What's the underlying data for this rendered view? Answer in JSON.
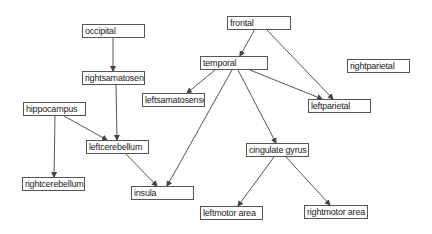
{
  "diagram": {
    "type": "directed-graph",
    "nodes": [
      {
        "id": "occipital",
        "label": "occipital",
        "x": 82,
        "y": 24,
        "w": 63
      },
      {
        "id": "rightsamatosens",
        "label": "rightsamatosens",
        "x": 82,
        "y": 71,
        "w": 63
      },
      {
        "id": "hippocampus",
        "label": "hippocampus",
        "x": 23,
        "y": 102,
        "w": 63
      },
      {
        "id": "leftcerebellum",
        "label": "leftcerebellum",
        "x": 86,
        "y": 140,
        "w": 63
      },
      {
        "id": "rightcerebellum",
        "label": "rightcerebellum",
        "x": 22,
        "y": 177,
        "w": 63
      },
      {
        "id": "insula",
        "label": "insula",
        "x": 131,
        "y": 186,
        "w": 63
      },
      {
        "id": "frontal",
        "label": "frontal",
        "x": 227,
        "y": 16,
        "w": 64
      },
      {
        "id": "temporal",
        "label": "temporal",
        "x": 200,
        "y": 56,
        "w": 68
      },
      {
        "id": "leftsamatosenso",
        "label": "leftsamatosenso",
        "x": 142,
        "y": 93,
        "w": 63
      },
      {
        "id": "rightparietal",
        "label": "rightparietal",
        "x": 347,
        "y": 59,
        "w": 63
      },
      {
        "id": "leftparietal",
        "label": "leftparietal",
        "x": 308,
        "y": 99,
        "w": 63
      },
      {
        "id": "cingulategyrus",
        "label": "cingulate gyrus",
        "x": 246,
        "y": 143,
        "w": 63
      },
      {
        "id": "leftmotorarea",
        "label": "leftmotor area",
        "x": 200,
        "y": 206,
        "w": 63
      },
      {
        "id": "rightmotorarea",
        "label": "rightmotor area",
        "x": 304,
        "y": 205,
        "w": 64
      }
    ],
    "edges": [
      {
        "from": "occipital",
        "to": "rightsamatosens",
        "x1": 113,
        "y1": 38,
        "x2": 113,
        "y2": 71
      },
      {
        "from": "rightsamatosens",
        "to": "leftcerebellum",
        "x1": 116,
        "y1": 85,
        "x2": 117,
        "y2": 140
      },
      {
        "from": "hippocampus",
        "to": "rightcerebellum",
        "x1": 55,
        "y1": 116,
        "x2": 54,
        "y2": 177
      },
      {
        "from": "hippocampus",
        "to": "leftcerebellum",
        "x1": 64,
        "y1": 116,
        "x2": 107,
        "y2": 140
      },
      {
        "from": "leftcerebellum",
        "to": "insula",
        "x1": 125,
        "y1": 153,
        "x2": 157,
        "y2": 186
      },
      {
        "from": "frontal",
        "to": "temporal",
        "x1": 255,
        "y1": 29,
        "x2": 240,
        "y2": 56
      },
      {
        "from": "frontal",
        "to": "leftparietal",
        "x1": 266,
        "y1": 29,
        "x2": 333,
        "y2": 99
      },
      {
        "from": "temporal",
        "to": "leftsamatosenso",
        "x1": 215,
        "y1": 70,
        "x2": 187,
        "y2": 93
      },
      {
        "from": "temporal",
        "to": "leftparietal",
        "x1": 250,
        "y1": 70,
        "x2": 322,
        "y2": 99
      },
      {
        "from": "temporal",
        "to": "insula",
        "x1": 232,
        "y1": 70,
        "x2": 167,
        "y2": 186
      },
      {
        "from": "temporal",
        "to": "cingulategyrus",
        "x1": 238,
        "y1": 70,
        "x2": 276,
        "y2": 143
      },
      {
        "from": "cingulategyrus",
        "to": "leftmotorarea",
        "x1": 274,
        "y1": 157,
        "x2": 238,
        "y2": 206
      },
      {
        "from": "cingulategyrus",
        "to": "rightmotorarea",
        "x1": 286,
        "y1": 157,
        "x2": 330,
        "y2": 205
      }
    ],
    "colors": {
      "line": "#555555",
      "border": "#555555",
      "text": "#222222",
      "background": "#ffffff"
    }
  }
}
